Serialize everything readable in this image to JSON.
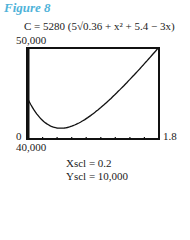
{
  "figure": {
    "title": "Figure 8",
    "formula": "C = 5280 (5√0.36 + x² + 5.4 − 3x)",
    "window": {
      "ymax_label": "50,000",
      "ymin_label": "40,000",
      "xmin_label": "0",
      "xmax_label": "1.8"
    },
    "xscl": "Xscl = 0.2",
    "yscl": "Yscl = 10,000"
  },
  "chart_data": {
    "type": "line",
    "title": "Figure 8",
    "subtitle": "C = 5280 (5√(0.36 + x²) + 5.4 − 3x)",
    "xlabel": "",
    "ylabel": "",
    "xlim": [
      0,
      1.8
    ],
    "ylim": [
      40000,
      50000
    ],
    "xscl": 0.2,
    "yscl": 10000,
    "grid": false,
    "x": [
      0,
      0.1,
      0.2,
      0.3,
      0.4,
      0.45,
      0.5,
      0.6,
      0.8,
      1.0,
      1.2,
      1.4,
      1.6,
      1.8
    ],
    "series": [
      {
        "name": "C",
        "values": [
          44352,
          43194,
          42304,
          41740,
          41451,
          41184,
          41407,
          41580,
          42564,
          43839,
          45328,
          46958,
          48691,
          50094
        ]
      }
    ]
  }
}
